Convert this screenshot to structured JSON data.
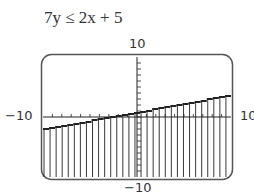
{
  "chart_data": {
    "type": "inequality-graph",
    "title": "7y ≤ 2x + 5",
    "inequality": "7y <= 2x + 5",
    "boundary_line": {
      "slope": 0.2857,
      "intercept": 0.7143,
      "style": "stepped (pixelated)"
    },
    "shading": "below the line (vertical fill lines)",
    "window": {
      "xmin": -10,
      "xmax": 10,
      "ymin": -10,
      "ymax": 10,
      "xscl": 1,
      "yscl": 1
    },
    "tick_labels": {
      "xmin": "−10",
      "xmax": "10",
      "ymin": "−10",
      "ymax": "10"
    },
    "grid": false,
    "colors": {
      "ink": "#222222",
      "frame": "#555555",
      "background": "#ffffff"
    }
  },
  "labels": {
    "title": "7y ≤ 2x + 5",
    "ymax": "10",
    "ymin": "−10",
    "xmin": "−10",
    "xmax": "10"
  }
}
